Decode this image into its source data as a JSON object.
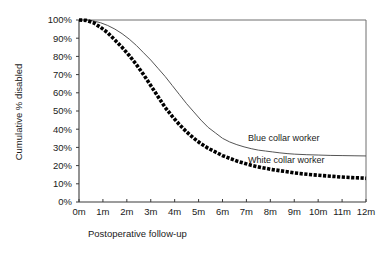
{
  "chart_data": {
    "type": "line",
    "title": "",
    "xlabel": "Postoperative follow-up",
    "ylabel": "Cumulative % disabled",
    "x_tick_labels": [
      "0m",
      "1m",
      "2m",
      "3m",
      "4m",
      "5m",
      "6m",
      "7m",
      "8m",
      "9m",
      "10m",
      "11m",
      "12m"
    ],
    "y_tick_labels": [
      "0%",
      "10%",
      "20%",
      "30%",
      "40%",
      "50%",
      "60%",
      "70%",
      "80%",
      "90%",
      "100%"
    ],
    "xlim": [
      0,
      12
    ],
    "ylim": [
      0,
      100
    ],
    "grid": false,
    "legend_position": "inline-right",
    "series": [
      {
        "name": "Blue collar worker",
        "style": "thin-solid-line",
        "color": "#555555",
        "label_x": 12.0,
        "label_y": 30.0,
        "x": [
          0,
          0.3,
          0.6,
          0.9,
          1.2,
          1.5,
          1.8,
          2.1,
          2.4,
          2.7,
          3.0,
          3.3,
          3.6,
          3.9,
          4.2,
          4.5,
          4.8,
          5.1,
          5.4,
          5.7,
          6.0,
          6.3,
          6.6,
          6.9,
          7.2,
          7.5,
          7.8,
          8.1,
          8.4,
          8.7,
          9.0,
          9.5,
          10.0,
          10.5,
          11.0,
          11.5,
          12.0
        ],
        "y": [
          100,
          100,
          99.5,
          98.5,
          97,
          95,
          92.5,
          89.5,
          86,
          82,
          78,
          73.5,
          69,
          64,
          59,
          54,
          49.5,
          45,
          41,
          38,
          35,
          33,
          31.5,
          30.3,
          29.3,
          28.5,
          28,
          27.5,
          27,
          26.6,
          26.3,
          26,
          25.8,
          25.6,
          25.5,
          25.4,
          25.3
        ]
      },
      {
        "name": "White collar worker",
        "style": "thick-dotted-line",
        "color": "#000000",
        "label_x": 12.0,
        "label_y": 13.0,
        "x": [
          0,
          0.3,
          0.6,
          0.9,
          1.2,
          1.5,
          1.8,
          2.1,
          2.4,
          2.7,
          3.0,
          3.3,
          3.6,
          3.9,
          4.2,
          4.5,
          4.8,
          5.1,
          5.4,
          5.7,
          6.0,
          6.3,
          6.6,
          6.9,
          7.2,
          7.5,
          7.8,
          8.1,
          8.4,
          8.7,
          9.0,
          9.4,
          9.8,
          10.2,
          10.6,
          11.0,
          11.4,
          11.8,
          12.0
        ],
        "y": [
          100,
          99.8,
          98.5,
          96,
          93,
          89,
          85,
          80.5,
          75.5,
          70,
          64,
          58,
          52,
          47,
          42.5,
          38.5,
          35,
          32,
          29.5,
          27.5,
          25.5,
          24,
          22.5,
          21.3,
          20.2,
          19.3,
          18.5,
          17.8,
          17.2,
          16.6,
          16,
          15.4,
          14.9,
          14.5,
          14.1,
          13.7,
          13.4,
          13.2,
          13.0
        ]
      }
    ]
  }
}
